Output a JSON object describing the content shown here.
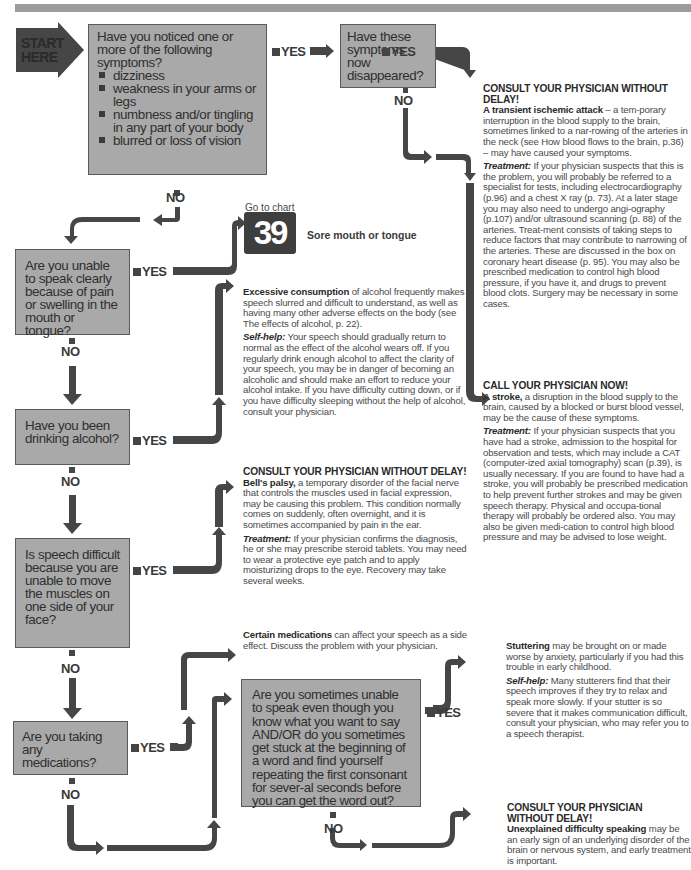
{
  "header": {
    "bar_color": "#9c9c9c"
  },
  "colors": {
    "box_fill": "#a9a9a9",
    "arrow": "#464646",
    "text": "#4a4a4a"
  },
  "start": {
    "line1": "START",
    "line2": "HERE"
  },
  "labels": {
    "yes": "YES",
    "no": "NO"
  },
  "questions": {
    "q1": {
      "text": "Have you noticed one or more of the following symptoms?",
      "bullets": [
        "dizziness",
        "weakness in your arms or legs",
        "numbness and/or tingling in any part of your body",
        "blurred or loss of vision"
      ]
    },
    "q2": {
      "text": "Have these symptoms now disappeared?"
    },
    "q3": {
      "text": "Are you unable to speak clearly because of pain or swelling in the mouth or tongue?"
    },
    "q4": {
      "text": "Have you been drinking alcohol?"
    },
    "q5": {
      "text": "Is speech difficult because you are unable to move the muscles on one side of your face?"
    },
    "q6": {
      "text": "Are you taking any medications?"
    },
    "q7": {
      "text": "Are you sometimes unable to speak even though you know what you want to say AND/OR do you sometimes get stuck at the beginning of a word and find yourself repeating the first consonant for sever-al seconds before you can get the word out?"
    }
  },
  "chart_ref": {
    "prefix": "Go to chart",
    "number": "39",
    "title": "Sore mouth or tongue"
  },
  "outcomes": {
    "tia": {
      "heading": "CONSULT YOUR PHYSICIAN WITHOUT DELAY!",
      "title": "A transient ischemic attack",
      "body": " – a tem-porary interruption in the blood supply to the brain, sometimes linked to a nar-rowing of the arteries in the neck (see How blood flows to the brain, p.36) – may have caused your symptoms.",
      "treatment_label": "Treatment:",
      "treatment": " If your physician suspects that this is the problem, you will probably be referred to a specialist for tests, including electrocardiography (p.96) and a chest X ray (p. 73). At a later stage you may also need to undergo angi-ography (p.107) and/or ultrasound scanning (p. 88) of the arteries. Treat-ment consists of taking steps to reduce factors that may contribute to narrowing of the arteries. These are discussed in the box on coronary heart disease (p. 95). You may also be prescribed medication to control high blood pressure, if you have it, and drugs to prevent blood clots. Surgery may be necessary in some cases."
    },
    "stroke": {
      "heading": "CALL YOUR PHYSICIAN NOW!",
      "title": "A stroke,",
      "body": " a disruption in the blood supply to the brain, caused by a blocked or burst blood vessel, may be the cause of these symptoms.",
      "treatment_label": "Treatment:",
      "treatment": " If your physician suspects that you have had a stroke, admission to the hospital for observation and tests, which may include a CAT (computer-ized axial tomography) scan (p.39), is usually necessary. If you are found to have had a stroke, you will probably be prescribed medication to help prevent further strokes and may be given speech therapy. Physical and occupa-tional therapy will probably be ordered also. You may also be given medi-cation to control high blood pressure and may be advised to lose weight."
    },
    "alcohol": {
      "title": "Excessive consumption",
      "body": " of alcohol frequently makes speech slurred and difficult to understand, as well as having many other adverse effects on the body (see The effects of alcohol, p. 22).",
      "selfhelp_label": "Self-help:",
      "selfhelp": " Your speech should gradually return to normal as the effect of the alcohol wears off. If you regularly drink enough alcohol to affect the clarity of your speech, you may be in danger of becoming an alcoholic and should make an effort to reduce your alcohol intake. If you have difficulty cutting down, or if you have difficulty sleeping without the help of alcohol, consult your physician."
    },
    "bells": {
      "heading": "CONSULT YOUR PHYSICIAN WITHOUT DELAY!",
      "title": "Bell's palsy,",
      "body": " a temporary disorder of the facial nerve that controls the muscles used in facial expression, may be causing this problem. This condition normally comes on suddenly, often overnight, and it is sometimes accompanied by pain in the ear.",
      "treatment_label": "Treatment:",
      "treatment": " If your physician confirms the diagnosis, he or she may prescribe steroid tablets. You may need to wear a protective eye patch and to apply moisturizing drops to the eye. Recovery may take several weeks."
    },
    "medications": {
      "title": "Certain medications",
      "body": " can affect your speech as a side effect. Discuss the problem with your physician."
    },
    "stuttering": {
      "title": "Stuttering",
      "body": " may be brought on or made worse by anxiety, particularly if you had this trouble in early childhood.",
      "selfhelp_label": "Self-help:",
      "selfhelp": " Many stutterers find that their speech improves if they try to relax and speak more slowly. If your stutter is so severe that it makes communication difficult, consult your physician, who may refer you to a speech therapist."
    },
    "unexplained": {
      "heading": "CONSULT YOUR PHYSICIAN WITHOUT DELAY!",
      "title": "Unexplained difficulty speaking",
      "body": " may be an early sign of an underlying disorder of the brain or nervous system, and early treatment is important."
    }
  }
}
